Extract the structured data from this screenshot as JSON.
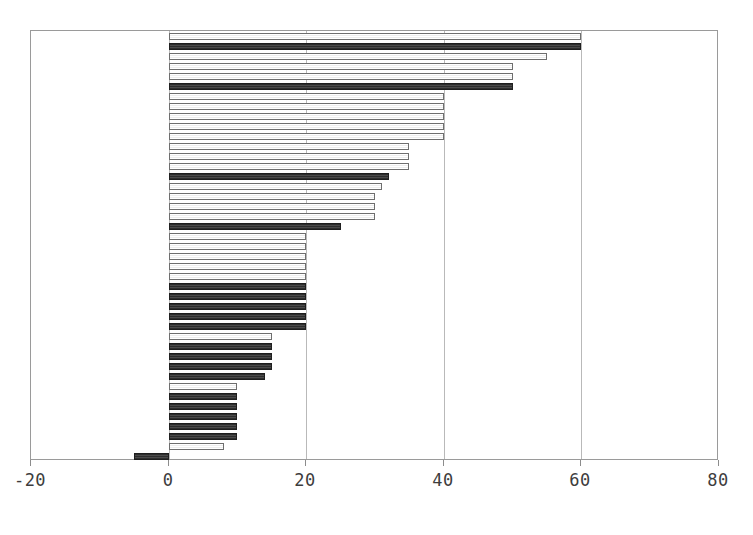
{
  "chart_data": {
    "type": "bar",
    "orientation": "horizontal",
    "title": "",
    "xlabel": "",
    "ylabel": "",
    "xlim": [
      -20,
      80
    ],
    "ylim": [
      0,
      43
    ],
    "grid": true,
    "legend": null,
    "xticks": [
      -20,
      0,
      20,
      40,
      60,
      80
    ],
    "xtick_labels": [
      "-20",
      "0",
      "20",
      "40",
      "60",
      "80"
    ],
    "baseline": 0,
    "categories": [
      "item-01",
      "item-02",
      "item-03",
      "item-04",
      "item-05",
      "item-06",
      "item-07",
      "item-08",
      "item-09",
      "item-10",
      "item-11",
      "item-12",
      "item-13",
      "item-14",
      "item-15",
      "item-16",
      "item-17",
      "item-18",
      "item-19",
      "item-20",
      "item-21",
      "item-22",
      "item-23",
      "item-24",
      "item-25",
      "item-26",
      "item-27",
      "item-28",
      "item-29",
      "item-30",
      "item-31",
      "item-32",
      "item-33",
      "item-34",
      "item-35",
      "item-36",
      "item-37",
      "item-38",
      "item-39",
      "item-40",
      "item-41",
      "item-42",
      "item-43"
    ],
    "values": [
      60,
      60,
      55,
      50,
      50,
      50,
      40,
      40,
      40,
      40,
      40,
      35,
      35,
      35,
      32,
      31,
      30,
      30,
      30,
      25,
      20,
      20,
      20,
      20,
      20,
      20,
      20,
      20,
      20,
      20,
      15,
      15,
      15,
      15,
      14,
      10,
      10,
      10,
      10,
      10,
      10,
      8,
      -5
    ],
    "fills": [
      "light",
      "dark",
      "light",
      "light",
      "light",
      "dark",
      "light",
      "light",
      "light",
      "light",
      "light",
      "light",
      "light",
      "light",
      "dark",
      "light",
      "light",
      "light",
      "light",
      "dark",
      "light",
      "light",
      "light",
      "light",
      "light",
      "dark",
      "dark",
      "dark",
      "dark",
      "dark",
      "light",
      "dark",
      "dark",
      "dark",
      "dark",
      "light",
      "dark",
      "dark",
      "dark",
      "dark",
      "dark",
      "light",
      "dark"
    ],
    "colors": {
      "light_fill": "#fbfbfb",
      "light_edge": "#6e6e6e",
      "dark_fill": "#3a3a3a",
      "dark_edge": "#1f1f1f",
      "gridline": "#b9b9b9",
      "frame": "#9a9a9a",
      "tick_text": "#3d3d3d",
      "background": "#ffffff"
    }
  }
}
